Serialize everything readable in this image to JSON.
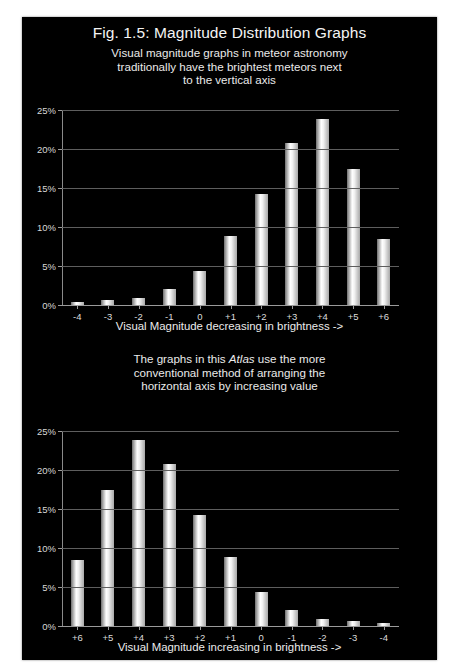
{
  "figure": {
    "title": "Fig. 1.5: Magnitude Distribution Graphs",
    "background_color": "#000000",
    "page_color": "#ffffff",
    "bar_color": "#ffffff"
  },
  "top_panel": {
    "subtitle_line1": "Visual magnitude graphs in meteor astronomy",
    "subtitle_line2": "traditionally have the brightest meteors next",
    "subtitle_line3": "to the vertical axis",
    "axis_title": "Visual Magnitude decreasing in brightness ->"
  },
  "bottom_panel": {
    "subtitle_line1_a": "The graphs in this ",
    "subtitle_line1_em": "Atlas",
    "subtitle_line1_b": " use the more",
    "subtitle_line2": "conventional method of arranging the",
    "subtitle_line3": "horizontal axis by increasing value",
    "axis_title": "Visual Magnitude increasing in brightness ->"
  },
  "chart_data": [
    {
      "type": "bar",
      "title": "Fig. 1.5: Magnitude Distribution Graphs",
      "subtitle": "Visual magnitude graphs in meteor astronomy traditionally have the brightest meteors next to the vertical axis",
      "xlabel": "Visual Magnitude decreasing in brightness ->",
      "ylabel": "",
      "categories": [
        "-4",
        "-3",
        "-2",
        "-1",
        "0",
        "+1",
        "+2",
        "+3",
        "+4",
        "+5",
        "+6"
      ],
      "values": [
        0.4,
        0.7,
        0.9,
        2.0,
        4.3,
        8.8,
        14.2,
        20.8,
        23.8,
        17.5,
        8.4
      ],
      "ytick_labels": [
        "0%",
        "5%",
        "10%",
        "15%",
        "20%",
        "25%"
      ],
      "ytick_values": [
        0,
        5,
        10,
        15,
        20,
        25
      ],
      "ylim": [
        0,
        25
      ],
      "grid": true,
      "legend": "none"
    },
    {
      "type": "bar",
      "title": "",
      "subtitle": "The graphs in this Atlas use the more conventional method of arranging the horizontal axis by increasing value",
      "xlabel": "Visual Magnitude increasing in brightness ->",
      "ylabel": "",
      "categories": [
        "+6",
        "+5",
        "+4",
        "+3",
        "+2",
        "+1",
        "0",
        "-1",
        "-2",
        "-3",
        "-4"
      ],
      "values": [
        8.4,
        17.5,
        23.8,
        20.8,
        14.2,
        8.8,
        4.3,
        2.0,
        0.9,
        0.7,
        0.4
      ],
      "ytick_labels": [
        "0%",
        "5%",
        "10%",
        "15%",
        "20%",
        "25%"
      ],
      "ytick_values": [
        0,
        5,
        10,
        15,
        20,
        25
      ],
      "ylim": [
        0,
        25
      ],
      "grid": true,
      "legend": "none"
    }
  ]
}
